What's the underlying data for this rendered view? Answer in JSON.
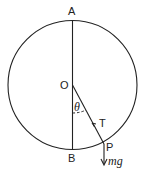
{
  "diagram": {
    "labels": {
      "top": "A",
      "bottom": "B",
      "center": "O",
      "angle": "θ",
      "tension": "T",
      "point": "P",
      "weight": "mg"
    },
    "colors": {
      "stroke": "#222222",
      "background": "#ffffff"
    }
  }
}
